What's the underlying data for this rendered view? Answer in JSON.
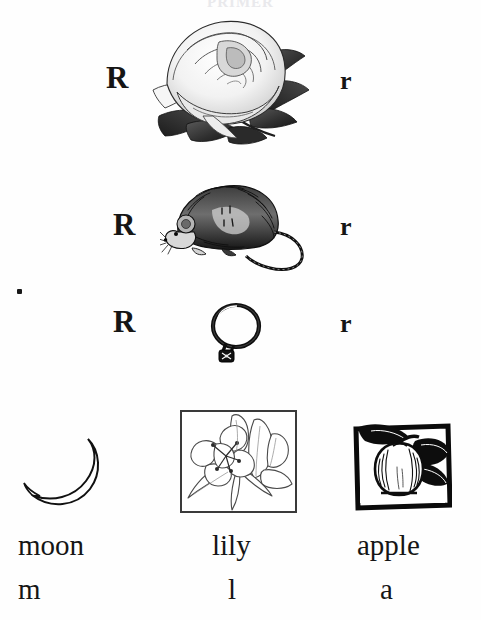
{
  "page": {
    "background_color": "#fefefe",
    "ink_color": "#151515",
    "width": 481,
    "height": 620,
    "header_ghost": "PRIMER"
  },
  "letter_rows": [
    {
      "id": "rose",
      "capital": "R",
      "lowercase": "r",
      "picture_name": "rose-illustration",
      "picture_caption": "rose"
    },
    {
      "id": "rat",
      "capital": "R",
      "lowercase": "r",
      "picture_name": "rat-illustration",
      "picture_caption": "rat"
    },
    {
      "id": "ring",
      "capital": "R",
      "lowercase": "r",
      "picture_name": "ring-illustration",
      "picture_caption": "ring"
    }
  ],
  "bottom_row": [
    {
      "id": "moon",
      "word": "moon",
      "letter": "m",
      "picture_name": "crescent-moon-illustration",
      "framed": false,
      "frame_style": "none"
    },
    {
      "id": "lily",
      "word": "lily",
      "letter": "l",
      "picture_name": "lily-illustration",
      "framed": true,
      "frame_style": "thin"
    },
    {
      "id": "apple",
      "word": "apple",
      "letter": "a",
      "picture_name": "apple-illustration",
      "framed": true,
      "frame_style": "bold"
    }
  ]
}
